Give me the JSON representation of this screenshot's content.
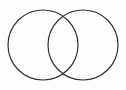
{
  "figure": {
    "type": "venn-diagram",
    "width": 126,
    "height": 90,
    "background_color": "#fdfdfd"
  },
  "style": {
    "stroke_color": "#2b2b2b",
    "stroke_width": 1.15,
    "fill": "none",
    "antialias": true
  },
  "chart_data": {
    "type": "diagram",
    "subtype": "venn2",
    "title": "",
    "sets": [
      {
        "id": "left",
        "label": "",
        "center_x": 43,
        "center_y": 45,
        "radius": 35,
        "stroke": "#2b2b2b"
      },
      {
        "id": "right",
        "label": "",
        "center_x": 83,
        "center_y": 45,
        "radius": 35,
        "stroke": "#2b2b2b"
      }
    ],
    "intersection": {
      "label": "",
      "top_point_x": 63,
      "top_point_y": 12,
      "bottom_point_x": 63,
      "bottom_point_y": 78,
      "center_x": 63,
      "center_y": 45
    },
    "bounds": {
      "left_x": 8,
      "right_x": 118,
      "top_y": 10,
      "bottom_y": 80
    },
    "labels": [],
    "legend": null,
    "grid": false
  },
  "regions": {
    "left_only": "",
    "right_only": "",
    "overlap": ""
  }
}
